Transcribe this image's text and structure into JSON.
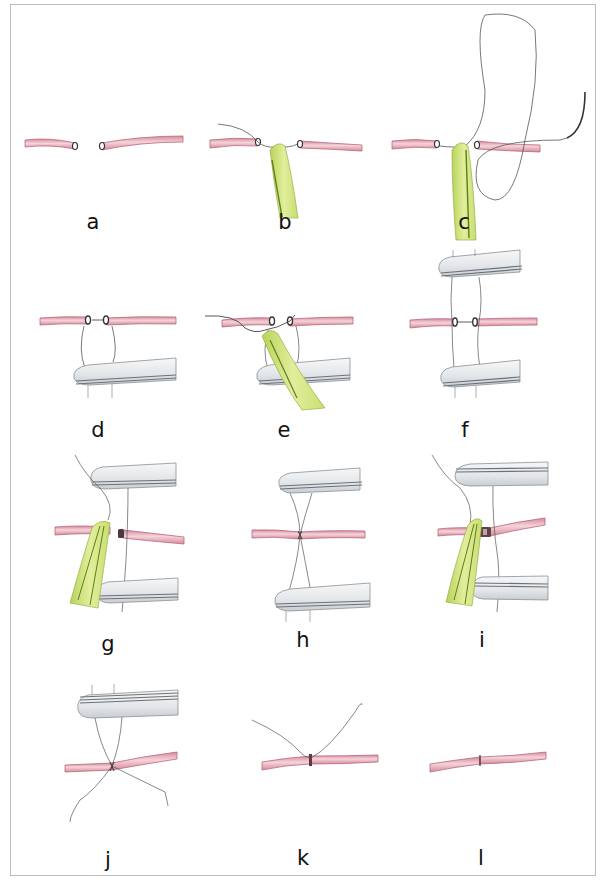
{
  "figure": {
    "colors": {
      "vessel": "#e8a7b4",
      "vessel_edge": "#b56a7a",
      "forceps_green": "#cfe07a",
      "forceps_green_dark": "#7a9a2a",
      "clamp": "#e9ecef",
      "clamp_edge": "#8a9096",
      "thread": "#555555"
    },
    "panels": [
      {
        "id": "a",
        "label": "a"
      },
      {
        "id": "b",
        "label": "b"
      },
      {
        "id": "c",
        "label": "c"
      },
      {
        "id": "d",
        "label": "d"
      },
      {
        "id": "e",
        "label": "e"
      },
      {
        "id": "f",
        "label": "f"
      },
      {
        "id": "g",
        "label": "g"
      },
      {
        "id": "h",
        "label": "h"
      },
      {
        "id": "i",
        "label": "i"
      },
      {
        "id": "j",
        "label": "j"
      },
      {
        "id": "k",
        "label": "k"
      },
      {
        "id": "l",
        "label": "l"
      }
    ]
  }
}
